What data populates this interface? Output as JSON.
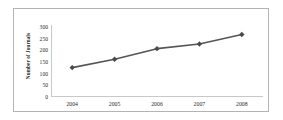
{
  "chart_data": {
    "type": "line",
    "title": "",
    "subtitle": "",
    "xlabel": "",
    "ylabel": "Number of Journals",
    "categories": [
      "2004",
      "2005",
      "2006",
      "2007",
      "2008"
    ],
    "x": [
      2004,
      2005,
      2006,
      2007,
      2008
    ],
    "values": [
      120,
      155,
      200,
      220,
      260
    ],
    "series": [
      {
        "name": "Number of Journals",
        "values": [
          120,
          155,
          200,
          220,
          260
        ]
      }
    ],
    "ylim": [
      0,
      300
    ],
    "yticks": [
      0,
      50,
      100,
      150,
      200,
      250,
      300
    ],
    "ytick_labels": [
      "0",
      "50",
      "100",
      "150",
      "200",
      "250",
      "300"
    ],
    "xtick_labels": [
      "2004",
      "2005",
      "2006",
      "2007",
      "2008"
    ],
    "grid": false,
    "legend": false,
    "legend_position": "none",
    "marker": "diamond",
    "line_color": "#555555",
    "marker_color": "#4a4a4a",
    "axis_color": "#c8c8c8",
    "frame_color": "#b4b4b4",
    "background": "#ffffff",
    "annotations": []
  }
}
